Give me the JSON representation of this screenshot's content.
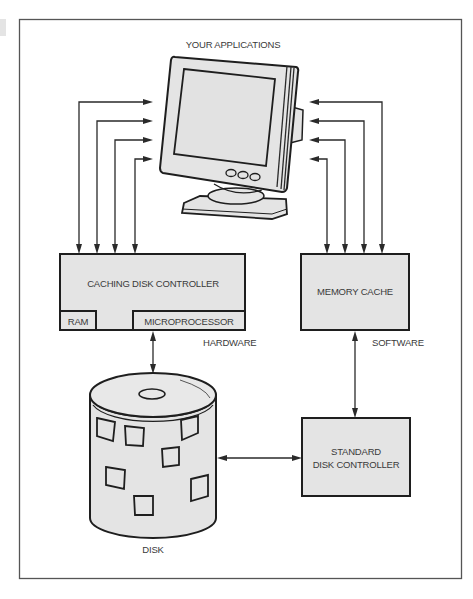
{
  "diagram": {
    "title_label": "YOUR APPLICATIONS",
    "nodes": {
      "caching_controller": "CACHING DISK CONTROLLER",
      "ram": "RAM",
      "microprocessor": "MICROPROCESSOR",
      "memory_cache": "MEMORY CACHE",
      "standard_controller_line1": "STANDARD",
      "standard_controller_line2": "DISK CONTROLLER",
      "disk": "DISK"
    },
    "side_labels": {
      "hardware": "HARDWARE",
      "software": "SOFTWARE"
    },
    "colors": {
      "box_fill": "#e4e4e4",
      "stroke": "#1e1e1e",
      "text": "#3a3a3a"
    }
  }
}
